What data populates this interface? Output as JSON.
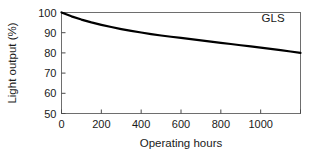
{
  "chart_data": {
    "type": "line",
    "title": "",
    "subtitle": "",
    "xlabel": "Operating hours",
    "ylabel": "Light output (%)",
    "xlim": [
      0,
      1200
    ],
    "ylim": [
      50,
      100
    ],
    "xticks": [
      0,
      200,
      400,
      600,
      800,
      1000
    ],
    "xtick_labels": [
      "0",
      "200",
      "400",
      "600",
      "800",
      "1000"
    ],
    "yticks": [
      50,
      60,
      70,
      80,
      90,
      100
    ],
    "ytick_labels": [
      "50",
      "60",
      "70",
      "80",
      "90",
      "100"
    ],
    "grid": false,
    "legend_position": "top-right-inside",
    "frame": "box",
    "series": [
      {
        "name": "GLS",
        "color": "#000000",
        "line_width": 2.2,
        "annotation": "GLS",
        "x": [
          0,
          50,
          100,
          150,
          200,
          250,
          300,
          350,
          400,
          450,
          500,
          550,
          600,
          650,
          700,
          750,
          800,
          850,
          900,
          950,
          1000,
          1050,
          1100,
          1150,
          1200
        ],
        "values": [
          100.0,
          98.1,
          96.5,
          95.1,
          93.9,
          92.8,
          91.8,
          90.9,
          90.1,
          89.3,
          88.6,
          88.0,
          87.4,
          86.8,
          86.2,
          85.6,
          85.0,
          84.4,
          83.8,
          83.2,
          82.6,
          82.0,
          81.4,
          80.7,
          80.0
        ]
      }
    ],
    "annotations": [
      {
        "text": "GLS",
        "x": 1120,
        "y": 97.5
      }
    ]
  },
  "axes": {
    "y_axis_title": "Light output (%)",
    "x_axis_title": "Operating hours"
  },
  "colors": {
    "curve": "#000000",
    "frame": "#6e6e6e",
    "text": "#1a1a1a",
    "background": "#ffffff"
  }
}
